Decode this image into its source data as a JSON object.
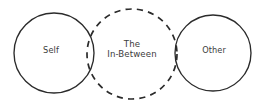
{
  "diagram": {
    "type": "three-circle-overlap-diagram",
    "background_color": "#ffffff",
    "stroke_color": "#2b2b2b",
    "text_color": "#3c3c3c",
    "nodes": [
      {
        "id": "self",
        "label": "Self",
        "shape": "circle",
        "stroke_style": "solid",
        "cx": 54,
        "cy": 53,
        "r": 40
      },
      {
        "id": "in-between",
        "label_line1": "The",
        "label_line2": "In-Between",
        "label": "The In-Between",
        "shape": "circle",
        "stroke_style": "dashed",
        "cx": 132,
        "cy": 54,
        "r": 45
      },
      {
        "id": "other",
        "label": "Other",
        "shape": "circle",
        "stroke_style": "solid",
        "cx": 213,
        "cy": 53,
        "r": 38
      }
    ]
  }
}
